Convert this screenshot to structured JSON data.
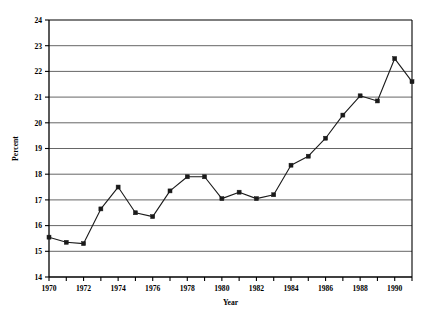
{
  "chart_data": {
    "type": "line",
    "title": "",
    "xlabel": "Year",
    "ylabel": "Percent",
    "xlim": [
      1970,
      1991
    ],
    "ylim": [
      14,
      24
    ],
    "ytick_step": 1,
    "xtick_step": 1,
    "xlabel_step": 2,
    "grid": "horizontal",
    "legend": "none",
    "marker": "filled-square",
    "line_color": "#1a1a1a",
    "grid_color": "#555555",
    "axis_color": "#000000",
    "x": [
      1970,
      1971,
      1972,
      1973,
      1974,
      1975,
      1976,
      1977,
      1978,
      1979,
      1980,
      1981,
      1982,
      1983,
      1984,
      1985,
      1986,
      1987,
      1988,
      1989,
      1990,
      1991
    ],
    "values": [
      15.55,
      15.35,
      15.3,
      16.65,
      17.5,
      16.5,
      16.35,
      17.35,
      17.9,
      17.9,
      17.05,
      17.3,
      17.05,
      17.2,
      18.35,
      18.7,
      19.4,
      20.3,
      21.05,
      20.85,
      22.5,
      21.6
    ],
    "series": [
      {
        "name": "Percent",
        "values": [
          15.55,
          15.35,
          15.3,
          16.65,
          17.5,
          16.5,
          16.35,
          17.35,
          17.9,
          17.9,
          17.05,
          17.3,
          17.05,
          17.2,
          18.35,
          18.7,
          19.4,
          20.3,
          21.05,
          20.85,
          22.5,
          21.6
        ]
      }
    ],
    "yticks": [
      14,
      15,
      16,
      17,
      18,
      19,
      20,
      21,
      22,
      23,
      24
    ],
    "ytick_labels": [
      "14",
      "15",
      "16",
      "17",
      "18",
      "19",
      "20",
      "21",
      "22",
      "23",
      "24"
    ],
    "xticks": [
      1970,
      1971,
      1972,
      1973,
      1974,
      1975,
      1976,
      1977,
      1978,
      1979,
      1980,
      1981,
      1982,
      1983,
      1984,
      1985,
      1986,
      1987,
      1988,
      1989,
      1990,
      1991
    ],
    "xtick_labels": [
      "1970",
      "",
      "1972",
      "",
      "1974",
      "",
      "1976",
      "",
      "1978",
      "",
      "1980",
      "",
      "1982",
      "",
      "1984",
      "",
      "1986",
      "",
      "1988",
      "",
      "1990",
      ""
    ]
  }
}
